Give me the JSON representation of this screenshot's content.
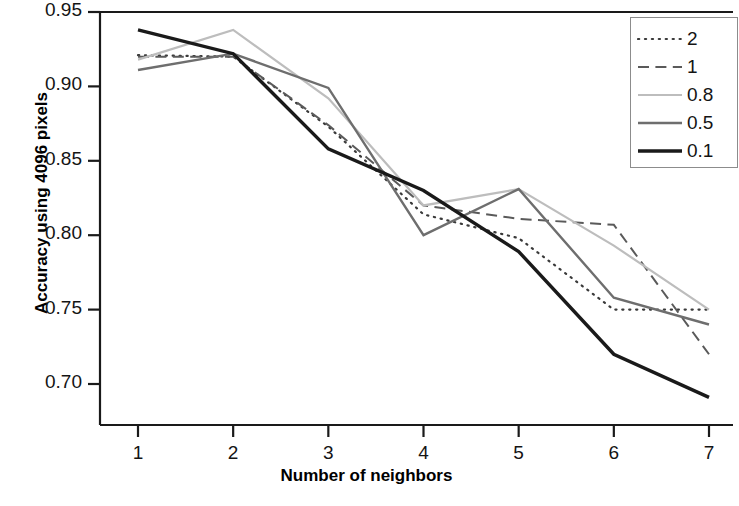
{
  "chart_data": {
    "type": "line",
    "title": "",
    "xlabel": "Number of neighbors",
    "ylabel": "Accuracy using 4096 pixels",
    "x": [
      1,
      2,
      3,
      4,
      5,
      6,
      7
    ],
    "xtick_labels": [
      "1",
      "2",
      "3",
      "4",
      "5",
      "6",
      "7"
    ],
    "ytick_labels": [
      "0.95",
      "0.90",
      "0.85",
      "0.80",
      "0.75",
      "0.70"
    ],
    "ytick_values": [
      0.95,
      0.9,
      0.85,
      0.8,
      0.75,
      0.7
    ],
    "xlim": [
      0.6,
      7.4
    ],
    "ylim": [
      0.676,
      0.958
    ],
    "grid": false,
    "legend_position": "top-right",
    "series": [
      {
        "name": "2",
        "style": "dotted",
        "color": "#3a3a3a",
        "width": 2.2,
        "values": [
          0.921,
          0.92,
          0.873,
          0.814,
          0.798,
          0.75,
          0.75
        ]
      },
      {
        "name": "1",
        "style": "dashed",
        "color": "#5a5a5a",
        "width": 2.0,
        "values": [
          0.92,
          0.92,
          0.874,
          0.82,
          0.811,
          0.807,
          0.72
        ]
      },
      {
        "name": "0.8",
        "style": "solid",
        "color": "#bdbdbd",
        "width": 2.2,
        "values": [
          0.918,
          0.938,
          0.892,
          0.82,
          0.831,
          0.793,
          0.75
        ]
      },
      {
        "name": "0.5",
        "style": "solid",
        "color": "#6e6e6e",
        "width": 2.4,
        "values": [
          0.911,
          0.922,
          0.899,
          0.8,
          0.831,
          0.758,
          0.74
        ]
      },
      {
        "name": "0.1",
        "style": "solid",
        "color": "#1a1a1a",
        "width": 3.4,
        "values": [
          0.938,
          0.922,
          0.858,
          0.83,
          0.789,
          0.72,
          0.691
        ]
      }
    ]
  },
  "axes": {
    "frame_color": "#1a1a1a"
  }
}
